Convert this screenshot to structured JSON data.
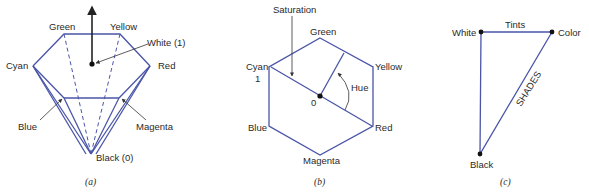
{
  "figure_a": {
    "labels": {
      "green": "Green",
      "yellow": "Yellow",
      "white": "White (1)",
      "cyan": "Cyan",
      "red": "Red",
      "blue": "Blue",
      "magenta": "Magenta",
      "black": "Black (0)"
    },
    "caption": "(a)"
  },
  "figure_b": {
    "labels": {
      "saturation": "Saturation",
      "green": "Green",
      "cyan": "Cyan",
      "cyan_value": "1",
      "yellow": "Yellow",
      "hue": "Hue",
      "origin": "0",
      "blue": "Blue",
      "red": "Red",
      "magenta": "Magenta"
    },
    "caption": "(b)"
  },
  "figure_c": {
    "labels": {
      "white": "White",
      "tints": "Tints",
      "color": "Color",
      "shades": "SHADES",
      "black": "Black"
    },
    "caption": "(c)"
  },
  "colors": {
    "edge": "#4a55a8",
    "text": "#2a2a2a"
  }
}
